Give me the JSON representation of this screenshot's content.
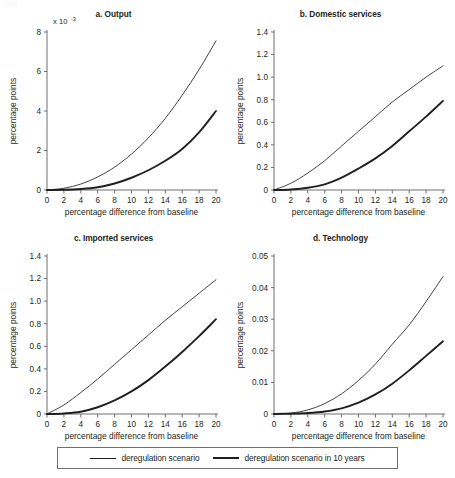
{
  "figure": {
    "background_color": "#ffffff",
    "line_color": "#231f20",
    "axis_color": "#6d6e71",
    "axis_label_x": "percentage difference from baseline",
    "axis_label_y": "percentage points"
  },
  "legend": {
    "position": "bottom-center",
    "entries": [
      {
        "label": "deregulation scenario",
        "style": "thin",
        "swatch": "line-swatch-thin"
      },
      {
        "label": "deregulation scenario in 10 years",
        "style": "thick",
        "swatch": "line-swatch-thick"
      }
    ]
  },
  "chart_data": [
    {
      "type": "line",
      "panel": "a",
      "title": "a. Output",
      "xlabel": "percentage difference from baseline",
      "ylabel": "percentage points",
      "y_exponent_label": "x 10",
      "y_exponent_sup": "-3",
      "xlim": [
        0,
        20
      ],
      "ylim": [
        0,
        8
      ],
      "xticks": [
        0,
        2,
        4,
        6,
        8,
        10,
        12,
        14,
        16,
        18,
        20
      ],
      "yticks": [
        0,
        2,
        4,
        6,
        8
      ],
      "ytick_labels": [
        "0",
        "2",
        "4",
        "6",
        "8"
      ],
      "grid": false,
      "x": [
        0,
        2,
        4,
        6,
        8,
        10,
        12,
        14,
        16,
        18,
        20
      ],
      "series": [
        {
          "name": "deregulation scenario",
          "style": "thin",
          "values": [
            0,
            0.09,
            0.3,
            0.66,
            1.16,
            1.82,
            2.64,
            3.63,
            4.8,
            6.1,
            7.55
          ]
        },
        {
          "name": "deregulation scenario in 10 years",
          "style": "thick",
          "values": [
            0,
            0.01,
            0.05,
            0.14,
            0.33,
            0.62,
            1.0,
            1.48,
            2.08,
            2.92,
            4.0
          ]
        }
      ]
    },
    {
      "type": "line",
      "panel": "b",
      "title": "b. Domestic services",
      "xlabel": "percentage difference from baseline",
      "ylabel": "percentage points",
      "xlim": [
        0,
        20
      ],
      "ylim": [
        0,
        1.4
      ],
      "xticks": [
        0,
        2,
        4,
        6,
        8,
        10,
        12,
        14,
        16,
        18,
        20
      ],
      "yticks": [
        0,
        0.2,
        0.4,
        0.6,
        0.8,
        1.0,
        1.2,
        1.4
      ],
      "ytick_labels": [
        "0",
        "0.2",
        "0.4",
        "0.6",
        "0.8",
        "1.0",
        "1.2",
        "1.4"
      ],
      "grid": false,
      "x": [
        0,
        2,
        4,
        6,
        8,
        10,
        12,
        14,
        16,
        18,
        20
      ],
      "series": [
        {
          "name": "deregulation scenario",
          "style": "thin",
          "values": [
            0,
            0.06,
            0.15,
            0.26,
            0.39,
            0.52,
            0.65,
            0.78,
            0.89,
            1.0,
            1.1
          ]
        },
        {
          "name": "deregulation scenario in 10 years",
          "style": "thick",
          "values": [
            0,
            0.005,
            0.02,
            0.05,
            0.11,
            0.19,
            0.28,
            0.39,
            0.52,
            0.65,
            0.79
          ]
        }
      ]
    },
    {
      "type": "line",
      "panel": "c",
      "title": "c. Imported services",
      "xlabel": "percentage difference from baseline",
      "ylabel": "percentage points",
      "xlim": [
        0,
        20
      ],
      "ylim": [
        0,
        1.4
      ],
      "xticks": [
        0,
        2,
        4,
        6,
        8,
        10,
        12,
        14,
        16,
        18,
        20
      ],
      "yticks": [
        0,
        0.2,
        0.4,
        0.6,
        0.8,
        1.0,
        1.2,
        1.4
      ],
      "ytick_labels": [
        "0",
        "0.2",
        "0.4",
        "0.6",
        "0.8",
        "1.0",
        "1.2",
        "1.4"
      ],
      "grid": false,
      "x": [
        0,
        2,
        4,
        6,
        8,
        10,
        12,
        14,
        16,
        18,
        20
      ],
      "series": [
        {
          "name": "deregulation scenario",
          "style": "thin",
          "values": [
            0,
            0.08,
            0.19,
            0.31,
            0.44,
            0.57,
            0.7,
            0.83,
            0.95,
            1.07,
            1.19
          ]
        },
        {
          "name": "deregulation scenario in 10 years",
          "style": "thick",
          "values": [
            0,
            0.005,
            0.02,
            0.06,
            0.12,
            0.2,
            0.3,
            0.42,
            0.55,
            0.69,
            0.84
          ]
        }
      ]
    },
    {
      "type": "line",
      "panel": "d",
      "title": "d. Technology",
      "xlabel": "percentage difference from baseline",
      "ylabel": "percentage points",
      "xlim": [
        0,
        20
      ],
      "ylim": [
        0,
        0.05
      ],
      "xticks": [
        0,
        2,
        4,
        6,
        8,
        10,
        12,
        14,
        16,
        18,
        20
      ],
      "yticks": [
        0,
        0.01,
        0.02,
        0.03,
        0.04,
        0.05
      ],
      "ytick_labels": [
        "0",
        "0.01",
        "0.02",
        "0.03",
        "0.04",
        "0.05"
      ],
      "grid": false,
      "x": [
        0,
        2,
        4,
        6,
        8,
        10,
        12,
        14,
        16,
        18,
        20
      ],
      "series": [
        {
          "name": "deregulation scenario",
          "style": "thin",
          "values": [
            0,
            0.0003,
            0.0013,
            0.0033,
            0.0064,
            0.0106,
            0.0158,
            0.0221,
            0.0282,
            0.0356,
            0.0435
          ]
        },
        {
          "name": "deregulation scenario in 10 years",
          "style": "thick",
          "values": [
            0,
            0.0001,
            0.0003,
            0.0008,
            0.0018,
            0.0036,
            0.0062,
            0.0096,
            0.0138,
            0.0184,
            0.023
          ]
        }
      ]
    }
  ]
}
